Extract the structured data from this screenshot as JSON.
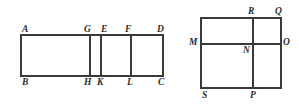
{
  "figure": {
    "stroke_color": "#3a3a3a",
    "label_color": "#2b2b2b",
    "background_color": "#ffffff",
    "stroke_width": 1.6
  },
  "left_figure": {
    "name": "rectangle-abcd-subdivided",
    "outline": {
      "x": 21,
      "y": 35,
      "width": 142,
      "height": 41
    },
    "dividers": [
      {
        "name": "segment-GH",
        "x": 90,
        "y1": 35,
        "y2": 76
      },
      {
        "name": "segment-EK",
        "x": 101,
        "y1": 35,
        "y2": 76
      },
      {
        "name": "segment-FL",
        "x": 131,
        "y1": 35,
        "y2": 76
      }
    ],
    "labels": [
      {
        "id": "A",
        "text": "A",
        "x": 22,
        "y": 25
      },
      {
        "id": "G",
        "text": "G",
        "x": 84,
        "y": 25
      },
      {
        "id": "E",
        "text": "E",
        "x": 101,
        "y": 25
      },
      {
        "id": "F",
        "text": "F",
        "x": 125,
        "y": 25
      },
      {
        "id": "D",
        "text": "D",
        "x": 157,
        "y": 25
      },
      {
        "id": "B",
        "text": "B",
        "x": 22,
        "y": 78
      },
      {
        "id": "H",
        "text": "H",
        "x": 84,
        "y": 78
      },
      {
        "id": "K",
        "text": "K",
        "x": 97,
        "y": 78
      },
      {
        "id": "L",
        "text": "L",
        "x": 127,
        "y": 78
      },
      {
        "id": "C",
        "text": "C",
        "x": 158,
        "y": 78
      }
    ]
  },
  "right_figure": {
    "name": "square-subdivided",
    "outline": {
      "x": 201,
      "y": 18,
      "width": 80,
      "height": 70
    },
    "dividers": [
      {
        "name": "segment-RP-vertical",
        "x": 253,
        "y1": 18,
        "y2": 88
      },
      {
        "name": "segment-MO-horizontal",
        "y": 44,
        "x1": 201,
        "x2": 281
      }
    ],
    "labels": [
      {
        "id": "R",
        "text": "R",
        "x": 248,
        "y": 7
      },
      {
        "id": "Q",
        "text": "Q",
        "x": 275,
        "y": 7
      },
      {
        "id": "M",
        "text": "M",
        "x": 189,
        "y": 39
      },
      {
        "id": "N",
        "text": "N",
        "x": 243,
        "y": 46
      },
      {
        "id": "O",
        "text": "O",
        "x": 283,
        "y": 39
      },
      {
        "id": "S",
        "text": "S",
        "x": 202,
        "y": 91
      },
      {
        "id": "P",
        "text": "P",
        "x": 250,
        "y": 91
      }
    ]
  }
}
